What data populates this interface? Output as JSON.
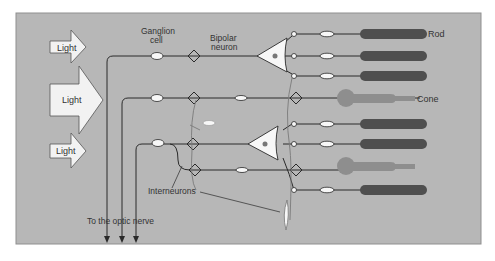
{
  "figure": {
    "colors": {
      "background": "#ffffff",
      "panel": "#b7b7b7",
      "panel_border": "#8f8f8f",
      "arrow_fill": "#f2f2f2",
      "line": "#2a2a2a",
      "rod": "#4f4f4f",
      "cone": "#8e8e8e",
      "interneuron": "#7a7a7a",
      "cell_body": "#f7f7f7"
    },
    "inputs": [
      {
        "label": "Light",
        "size": "small"
      },
      {
        "label": "Light",
        "size": "large"
      },
      {
        "label": "Light",
        "size": "small"
      }
    ],
    "labels": {
      "ganglion": "Ganglion cell",
      "ganglion_line1": "Ganglion",
      "ganglion_line2": "cell",
      "bipolar": "Bipolar neuron",
      "bipolar_line1": "Bipolar",
      "bipolar_line2": "neuron",
      "rod": "Rod",
      "cone": "Cone",
      "interneurons": "Interneurons",
      "optic_nerve": "To the optic nerve"
    },
    "photoreceptors": [
      {
        "type": "rod",
        "row": 1
      },
      {
        "type": "rod",
        "row": 2
      },
      {
        "type": "rod",
        "row": 3
      },
      {
        "type": "cone",
        "row": 4
      },
      {
        "type": "rod",
        "row": 5
      },
      {
        "type": "rod",
        "row": 6
      },
      {
        "type": "cone",
        "row": 7
      },
      {
        "type": "rod",
        "row": 8
      }
    ]
  }
}
